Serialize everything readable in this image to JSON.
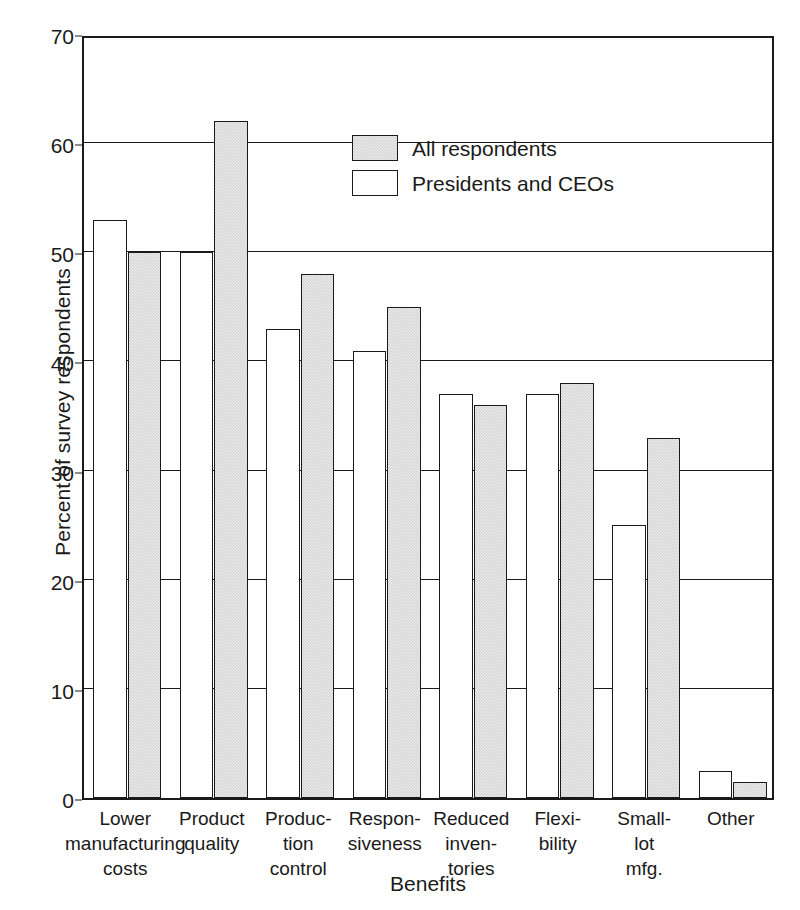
{
  "chart_data": {
    "type": "bar",
    "title": "",
    "xlabel": "Benefits",
    "ylabel": "Percent of survey respondents",
    "ylim": [
      0,
      70
    ],
    "ytick_step": 10,
    "yticks": [
      0,
      10,
      20,
      30,
      40,
      50,
      60,
      70
    ],
    "grid": "horizontal",
    "legend_position": "upper-center-right",
    "categories": [
      "Lower\nmanufacturing\ncosts",
      "Product\nquality",
      "Produc-\ntion\ncontrol",
      "Respon-\nsiveness",
      "Reduced\ninven-\ntories",
      "Flexi-\nbility",
      "Small-\nlot\nmfg.",
      "Other"
    ],
    "series": [
      {
        "name": "Presidents and CEOs",
        "color": "#ffffff",
        "values": [
          53,
          50,
          43,
          41,
          37,
          37,
          25,
          2.5
        ]
      },
      {
        "name": "All respondents",
        "color": "#d6d6d6",
        "values": [
          50,
          62,
          48,
          45,
          36,
          38,
          33,
          1.5
        ]
      }
    ],
    "legend": [
      {
        "label": "All respondents",
        "swatch": "gray"
      },
      {
        "label": "Presidents and CEOs",
        "swatch": "white"
      }
    ]
  },
  "axes": {
    "y_tick_labels": [
      "70",
      "60",
      "50",
      "40",
      "30",
      "20",
      "10",
      "0"
    ],
    "y_title": "Percent of survey respondents",
    "x_title": "Benefits"
  },
  "colors": {
    "ink": "#1a1a1a",
    "bar_gray": "#d6d6d6",
    "bar_white": "#ffffff",
    "background": "#ffffff"
  }
}
